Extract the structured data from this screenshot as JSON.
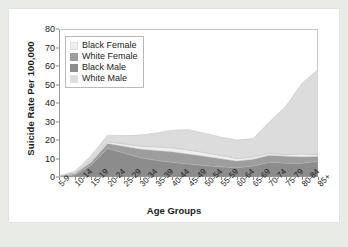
{
  "chart_data": {
    "type": "area",
    "stacked": true,
    "title": "",
    "xlabel": "Age Groups",
    "ylabel": "Suicide Rate Per 100,000",
    "ylim": [
      0,
      80
    ],
    "yticks": [
      0,
      10,
      20,
      30,
      40,
      50,
      60,
      70,
      80
    ],
    "grid": false,
    "legend_position": "top-left",
    "categories": [
      "5-9",
      "10-14",
      "15-19",
      "20-24",
      "25-29",
      "30-34",
      "35-39",
      "40-44",
      "45-49",
      "50-54",
      "55-59",
      "60-64",
      "65-69",
      "70-74",
      "75-79",
      "80-84",
      "85+"
    ],
    "series": [
      {
        "name": "Black Female",
        "color": "#efefef",
        "values": [
          0.1,
          0.4,
          0.7,
          1.0,
          1.3,
          1.6,
          2.0,
          2.2,
          2.2,
          2.0,
          1.7,
          1.4,
          1.2,
          1.0,
          0.9,
          1.6,
          1.0
        ]
      },
      {
        "name": "White Female",
        "color": "#9d9d9d",
        "values": [
          0.1,
          0.7,
          1.6,
          2.6,
          3.6,
          4.6,
          5.3,
          5.6,
          5.4,
          5.0,
          4.4,
          3.6,
          3.6,
          3.8,
          3.7,
          3.4,
          2.6
        ]
      },
      {
        "name": "Black Male",
        "color": "#8c8c8c",
        "values": [
          0.2,
          1.2,
          6.5,
          15.5,
          13.0,
          10.5,
          9.0,
          8.0,
          7.0,
          6.2,
          5.5,
          5.0,
          6.0,
          8.0,
          7.5,
          7.5,
          8.5
        ]
      },
      {
        "name": "White Male",
        "color": "#dcdcdc",
        "values": [
          0.1,
          1.0,
          3.0,
          3.5,
          4.5,
          6.0,
          7.5,
          9.5,
          11.0,
          10.5,
          10.0,
          10.0,
          10.0,
          17.0,
          26.0,
          38.0,
          46.0
        ]
      }
    ],
    "stack_order": [
      "Black Male",
      "White Female",
      "Black Female",
      "White Male"
    ],
    "totals": [
      0.5,
      3.3,
      11.8,
      22.6,
      22.4,
      22.7,
      23.8,
      25.3,
      25.6,
      23.7,
      21.6,
      20.0,
      20.8,
      29.8,
      38.1,
      50.5,
      58.1
    ]
  },
  "legend": {
    "items": [
      {
        "label": "Black Female",
        "color": "#efefef"
      },
      {
        "label": "White Female",
        "color": "#9d9d9d"
      },
      {
        "label": "Black Male",
        "color": "#8c8c8c"
      },
      {
        "label": "White Male",
        "color": "#dcdcdc"
      }
    ]
  }
}
